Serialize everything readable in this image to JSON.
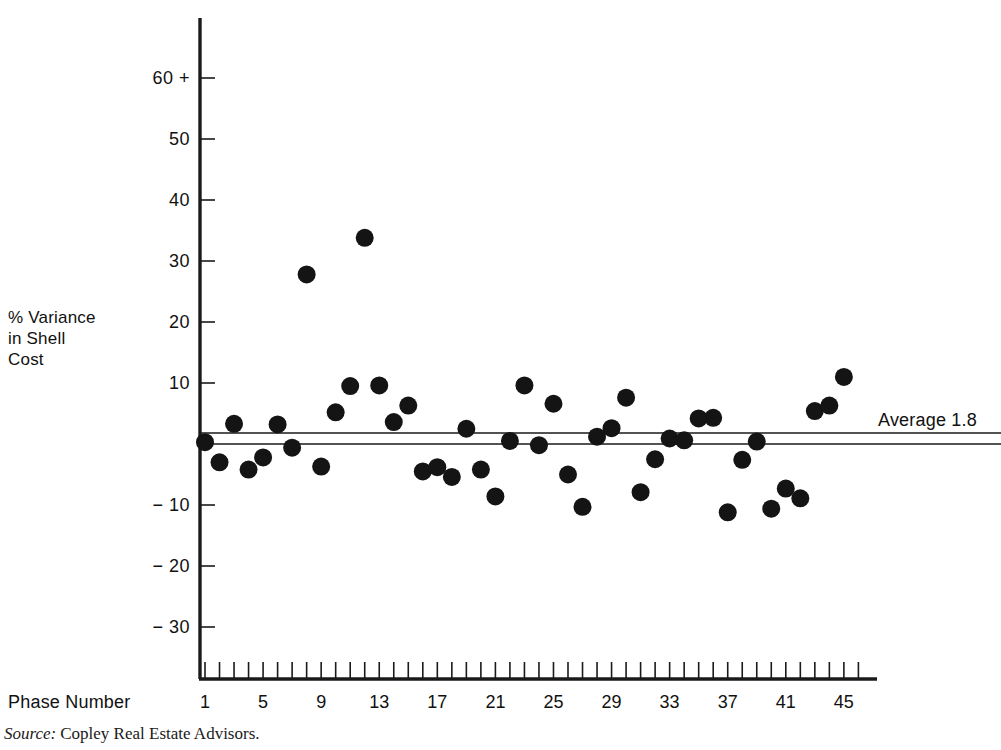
{
  "figure": {
    "source_prefix": "Source:",
    "source_text": "Copley Real Estate Advisors."
  },
  "chart_data": {
    "type": "scatter",
    "title": "",
    "xlabel": "Phase Number",
    "ylabel": "% Variance\nin Shell\nCost",
    "ylabel_lines": [
      "% Variance",
      "in Shell",
      "Cost"
    ],
    "xlim": [
      0.2,
      46.8
    ],
    "ylim": [
      -36,
      64
    ],
    "grid": false,
    "legend": null,
    "y_ticks": [
      60,
      50,
      40,
      30,
      20,
      10,
      0,
      -10,
      -20,
      -30
    ],
    "y_tick_labels": [
      "60 +",
      "50",
      "40",
      "30",
      "20",
      "10",
      "",
      "− 10",
      "− 20",
      "− 30"
    ],
    "x_ticks": [
      1,
      2,
      3,
      4,
      5,
      6,
      7,
      8,
      9,
      10,
      11,
      12,
      13,
      14,
      15,
      16,
      17,
      18,
      19,
      20,
      21,
      22,
      23,
      24,
      25,
      26,
      27,
      28,
      29,
      30,
      31,
      32,
      33,
      34,
      35,
      36,
      37,
      38,
      39,
      40,
      41,
      42,
      43,
      44,
      45,
      46
    ],
    "x_tick_labels": [
      {
        "x": 1,
        "label": "1"
      },
      {
        "x": 5,
        "label": "5"
      },
      {
        "x": 9,
        "label": "9"
      },
      {
        "x": 13,
        "label": "13"
      },
      {
        "x": 17,
        "label": "17"
      },
      {
        "x": 21,
        "label": "21"
      },
      {
        "x": 25,
        "label": "25"
      },
      {
        "x": 29,
        "label": "29"
      },
      {
        "x": 33,
        "label": "33"
      },
      {
        "x": 37,
        "label": "37"
      },
      {
        "x": 41,
        "label": "41"
      },
      {
        "x": 45,
        "label": "45"
      }
    ],
    "reference_lines": [
      {
        "name": "zero-line",
        "y": 0
      },
      {
        "name": "average-line",
        "y": 1.8,
        "label": "Average 1.8"
      }
    ],
    "annotations": [
      {
        "name": "average-annotation",
        "text": "Average 1.8",
        "y": 1.8,
        "x": 47
      }
    ],
    "marker": {
      "shape": "circle",
      "size": 9,
      "color": "#141414"
    },
    "points": [
      {
        "x": 1,
        "y": 0.3
      },
      {
        "x": 2,
        "y": -3.0
      },
      {
        "x": 3,
        "y": 3.3
      },
      {
        "x": 4,
        "y": -4.2
      },
      {
        "x": 5,
        "y": -2.2
      },
      {
        "x": 6,
        "y": 3.2
      },
      {
        "x": 7,
        "y": -0.6
      },
      {
        "x": 8,
        "y": 27.8
      },
      {
        "x": 9,
        "y": -3.7
      },
      {
        "x": 10,
        "y": 5.2
      },
      {
        "x": 11,
        "y": 9.5
      },
      {
        "x": 12,
        "y": 33.8
      },
      {
        "x": 13,
        "y": 9.6
      },
      {
        "x": 14,
        "y": 3.6
      },
      {
        "x": 15,
        "y": 6.3
      },
      {
        "x": 16,
        "y": -4.5
      },
      {
        "x": 17,
        "y": -3.8
      },
      {
        "x": 18,
        "y": -5.4
      },
      {
        "x": 19,
        "y": 2.5
      },
      {
        "x": 20,
        "y": -4.2
      },
      {
        "x": 21,
        "y": -8.6
      },
      {
        "x": 22,
        "y": 0.5
      },
      {
        "x": 23,
        "y": 9.6
      },
      {
        "x": 24,
        "y": -0.2
      },
      {
        "x": 25,
        "y": 6.6
      },
      {
        "x": 26,
        "y": -5.0
      },
      {
        "x": 27,
        "y": -10.3
      },
      {
        "x": 28,
        "y": 1.2
      },
      {
        "x": 29,
        "y": 2.6
      },
      {
        "x": 30,
        "y": 7.6
      },
      {
        "x": 31,
        "y": -7.9
      },
      {
        "x": 32,
        "y": -2.5
      },
      {
        "x": 33,
        "y": 0.9
      },
      {
        "x": 34,
        "y": 0.6
      },
      {
        "x": 35,
        "y": 4.2
      },
      {
        "x": 36,
        "y": 4.3
      },
      {
        "x": 37,
        "y": -11.2
      },
      {
        "x": 38,
        "y": -2.6
      },
      {
        "x": 39,
        "y": 0.4
      },
      {
        "x": 40,
        "y": -10.6
      },
      {
        "x": 41,
        "y": -7.3
      },
      {
        "x": 42,
        "y": -8.9
      },
      {
        "x": 43,
        "y": 5.4
      },
      {
        "x": 44,
        "y": 6.3
      },
      {
        "x": 45,
        "y": 11.0
      }
    ]
  }
}
